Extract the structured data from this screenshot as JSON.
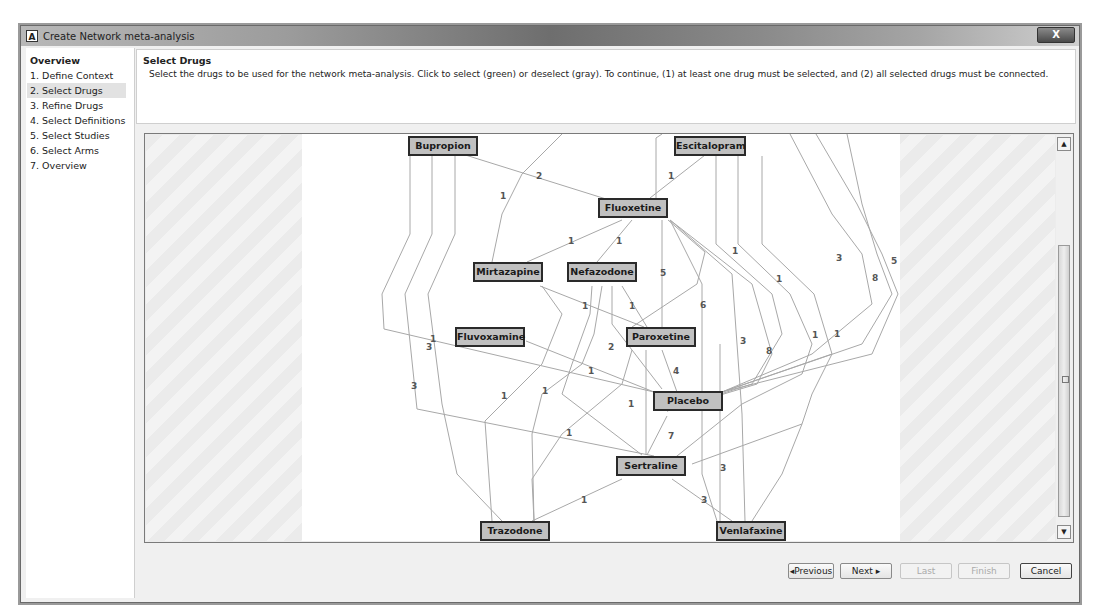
{
  "window": {
    "title": "Create Network meta-analysis",
    "app_icon": "A",
    "close_label": "X"
  },
  "sidebar": {
    "items": [
      {
        "label": "Overview",
        "header": true
      },
      {
        "label": "1. Define Context"
      },
      {
        "label": "2. Select Drugs",
        "active": true
      },
      {
        "label": "3. Refine Drugs"
      },
      {
        "label": "4. Select Definitions"
      },
      {
        "label": "5. Select Studies"
      },
      {
        "label": "6. Select Arms"
      },
      {
        "label": "7. Overview"
      }
    ]
  },
  "header": {
    "title": "Select Drugs",
    "description": "Select the drugs to be used for the network meta-analysis. Click to select (green) or deselect (gray). To continue, (1) at least one drug must be selected, and (2) all selected drugs must be connected."
  },
  "graph": {
    "nodes": [
      {
        "id": "bupropion",
        "label": "Bupropion",
        "x": 408,
        "y": 136,
        "w": 70
      },
      {
        "id": "escitalopram",
        "label": "Escitalopram",
        "x": 674,
        "y": 136,
        "w": 72
      },
      {
        "id": "fluoxetine",
        "label": "Fluoxetine",
        "x": 598,
        "y": 198,
        "w": 70
      },
      {
        "id": "mirtazapine",
        "label": "Mirtazapine",
        "x": 473,
        "y": 262,
        "w": 70
      },
      {
        "id": "nefazodone",
        "label": "Nefazodone",
        "x": 567,
        "y": 262,
        "w": 70
      },
      {
        "id": "fluvoxamine",
        "label": "Fluvoxamine",
        "x": 455,
        "y": 327,
        "w": 70
      },
      {
        "id": "paroxetine",
        "label": "Paroxetine",
        "x": 626,
        "y": 327,
        "w": 70
      },
      {
        "id": "placebo",
        "label": "Placebo",
        "x": 653,
        "y": 391,
        "w": 70
      },
      {
        "id": "sertraline",
        "label": "Sertraline",
        "x": 616,
        "y": 456,
        "w": 70
      },
      {
        "id": "trazodone",
        "label": "Trazodone",
        "x": 480,
        "y": 521,
        "w": 70
      },
      {
        "id": "venlafaxine",
        "label": "Venlafaxine",
        "x": 716,
        "y": 521,
        "w": 70
      }
    ],
    "edge_labels": [
      {
        "text": "2",
        "x": 536,
        "y": 171
      },
      {
        "text": "1",
        "x": 500,
        "y": 191
      },
      {
        "text": "1",
        "x": 668,
        "y": 171
      },
      {
        "text": "1",
        "x": 568,
        "y": 236
      },
      {
        "text": "1",
        "x": 616,
        "y": 236
      },
      {
        "text": "5",
        "x": 660,
        "y": 268
      },
      {
        "text": "1",
        "x": 732,
        "y": 246
      },
      {
        "text": "1",
        "x": 776,
        "y": 274
      },
      {
        "text": "3",
        "x": 836,
        "y": 253
      },
      {
        "text": "5",
        "x": 891,
        "y": 256
      },
      {
        "text": "8",
        "x": 872,
        "y": 273
      },
      {
        "text": "6",
        "x": 700,
        "y": 300
      },
      {
        "text": "1",
        "x": 582,
        "y": 301
      },
      {
        "text": "1",
        "x": 629,
        "y": 301
      },
      {
        "text": "1",
        "x": 430,
        "y": 334
      },
      {
        "text": "3",
        "x": 426,
        "y": 342
      },
      {
        "text": "2",
        "x": 608,
        "y": 342
      },
      {
        "text": "3",
        "x": 740,
        "y": 336
      },
      {
        "text": "8",
        "x": 766,
        "y": 346
      },
      {
        "text": "1",
        "x": 812,
        "y": 330
      },
      {
        "text": "1",
        "x": 834,
        "y": 329
      },
      {
        "text": "1",
        "x": 588,
        "y": 366
      },
      {
        "text": "4",
        "x": 673,
        "y": 366
      },
      {
        "text": "3",
        "x": 411,
        "y": 381
      },
      {
        "text": "1",
        "x": 501,
        "y": 391
      },
      {
        "text": "1",
        "x": 542,
        "y": 386
      },
      {
        "text": "1",
        "x": 628,
        "y": 399
      },
      {
        "text": "1",
        "x": 566,
        "y": 428
      },
      {
        "text": "7",
        "x": 668,
        "y": 431
      },
      {
        "text": "3",
        "x": 720,
        "y": 463
      },
      {
        "text": "1",
        "x": 581,
        "y": 495
      },
      {
        "text": "3",
        "x": 701,
        "y": 495
      },
      {
        "text": "1",
        "x": 660,
        "y": 132
      }
    ]
  },
  "footer": {
    "previous": "◂Previous",
    "next": "Next ▸",
    "last": "Last",
    "finish": "Finish",
    "cancel": "Cancel"
  },
  "colors": {
    "node_fill": "#c0c0c0",
    "node_border": "#2a2a2a",
    "edge": "#a8a8a8",
    "edge_label": "#555555"
  }
}
